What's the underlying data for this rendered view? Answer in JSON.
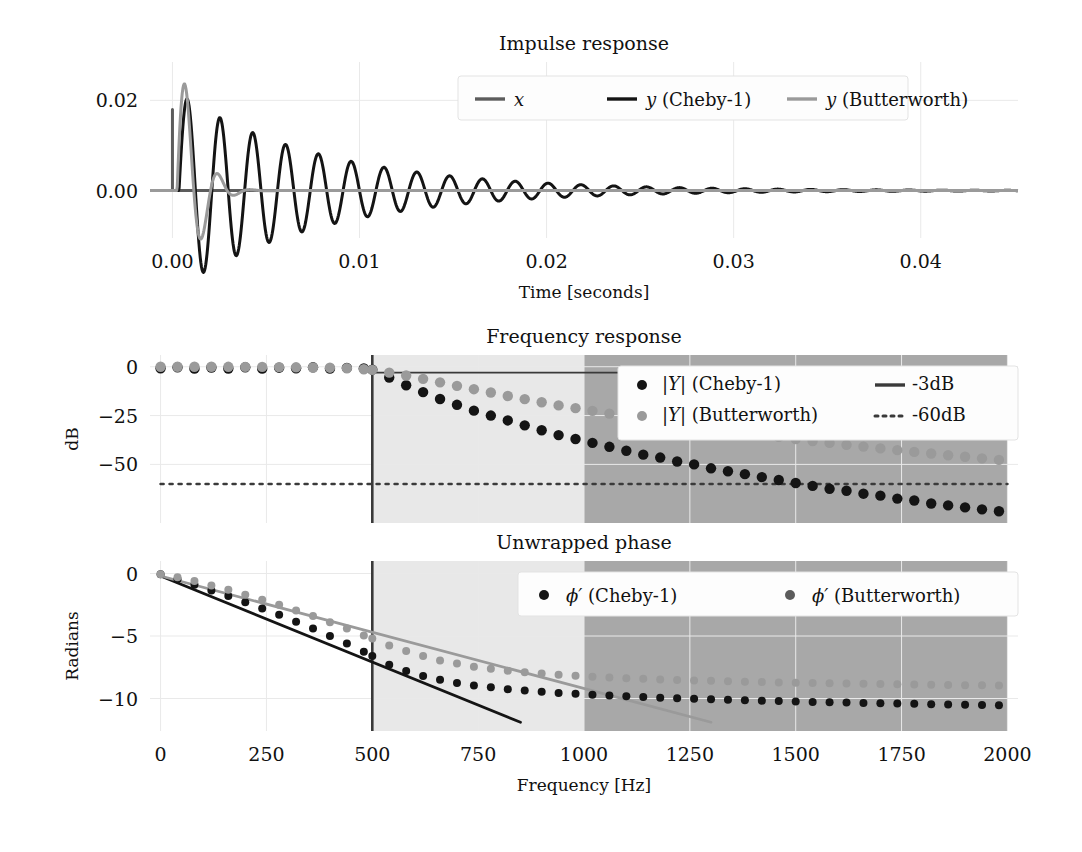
{
  "figure": {
    "background": "#ffffff",
    "colors": {
      "impulse": "#5c5c5c",
      "cheby": "#141414",
      "butter": "#9a9a9a",
      "band_pass_stop": "#e8e8e8",
      "band_stop": "#a8a8a8",
      "grid": "#e9e9e9",
      "cut_line": "#3a3a3a"
    }
  },
  "chart_data": [
    {
      "type": "line",
      "panel": "impulse",
      "title": "Impulse response",
      "xlabel": "Time [seconds]",
      "ylabel": "",
      "xlim": [
        -0.0012,
        0.0452
      ],
      "ylim": [
        -0.0105,
        0.0285
      ],
      "xticks": [
        0.0,
        0.01,
        0.02,
        0.03,
        0.04
      ],
      "xticklabels": [
        "0.00",
        "0.01",
        "0.02",
        "0.03",
        "0.04"
      ],
      "yticks": [
        0.0,
        0.02
      ],
      "yticklabels": [
        "0.00",
        "0.02"
      ],
      "grid": true,
      "legend_position": "upper center",
      "series": [
        {
          "name": "x",
          "style": "line",
          "color": "#5c5c5c",
          "description": "unit impulse at t=0, amplitude 0.018, zero elsewhere",
          "points": [
            [
              0.0,
              0.0
            ],
            [
              0.0,
              0.018
            ],
            [
              0.0,
              0.0
            ],
            [
              0.045,
              0.0
            ]
          ]
        },
        {
          "name": "y (Cheby-1)",
          "style": "line",
          "color": "#141414",
          "description": "Chebyshev type-1 impulse response: damped ringing, peak 0.0175 at t~0.0011, long decaying oscillation",
          "decay": 130.0,
          "frequency_hz": 570.0,
          "amplitude": 0.0215,
          "phase": 0.0,
          "delay": 0.00035
        },
        {
          "name": "y (Butterworth)",
          "style": "line",
          "color": "#9a9a9a",
          "description": "Butterworth impulse response: higher first peak 0.0255 at t~0.0008, fast decay, negligible after t=0.007",
          "decay": 620.0,
          "frequency_hz": 560.0,
          "amplitude": 0.0315,
          "phase": 0.0,
          "delay": 0.00025
        }
      ]
    },
    {
      "type": "scatter",
      "panel": "magnitude",
      "title": "Frequency response",
      "xlabel": "",
      "ylabel": "dB",
      "xlim": [
        -25,
        2025
      ],
      "ylim": [
        -80,
        6
      ],
      "xticks": [
        0,
        250,
        500,
        750,
        1000,
        1250,
        1500,
        1750,
        2000
      ],
      "xticklabels": [
        "0",
        "250",
        "500",
        "750",
        "1000",
        "1250",
        "1500",
        "1750",
        "2000"
      ],
      "yticks": [
        0,
        -25,
        -50
      ],
      "yticklabels": [
        "0",
        "−25",
        "−50"
      ],
      "grid": true,
      "legend_position": "upper right",
      "annotations": [
        {
          "kind": "vline",
          "x": 500,
          "label": "cutoff"
        },
        {
          "kind": "hline",
          "y": -3,
          "label": "-3dB",
          "x_from": 500,
          "x_to": 2000
        },
        {
          "kind": "hline",
          "y": -60,
          "label": "-60dB",
          "x_from": 0,
          "x_to": 2000
        },
        {
          "kind": "vspan",
          "x_from": 500,
          "x_to": 1000,
          "color": "#e8e8e8",
          "label": "transition band"
        },
        {
          "kind": "vspan",
          "x_from": 1000,
          "x_to": 2000,
          "color": "#a8a8a8",
          "label": "stop band"
        }
      ],
      "series": [
        {
          "name": "|Y| (Cheby-1)",
          "style": "dots",
          "color": "#141414",
          "x": [
            0,
            40,
            80,
            120,
            160,
            200,
            240,
            280,
            320,
            360,
            400,
            440,
            480,
            500,
            540,
            580,
            620,
            660,
            700,
            740,
            780,
            820,
            860,
            900,
            940,
            980,
            1020,
            1060,
            1100,
            1140,
            1180,
            1220,
            1260,
            1300,
            1340,
            1380,
            1420,
            1460,
            1500,
            1540,
            1580,
            1620,
            1660,
            1700,
            1740,
            1780,
            1820,
            1860,
            1900,
            1940,
            1980
          ],
          "y": [
            -0.8,
            -0.3,
            -1.0,
            -0.4,
            -0.9,
            -0.3,
            -1.0,
            -0.5,
            -0.8,
            -0.3,
            -1.0,
            -0.6,
            -0.9,
            -1.5,
            -5.5,
            -9.5,
            -13.0,
            -16.5,
            -19.5,
            -22.5,
            -25.0,
            -27.5,
            -30.0,
            -32.5,
            -35.0,
            -37.0,
            -39.0,
            -41.0,
            -43.0,
            -45.0,
            -46.5,
            -48.5,
            -50.0,
            -52.0,
            -53.5,
            -55.0,
            -56.5,
            -58.0,
            -59.5,
            -61.0,
            -62.5,
            -63.5,
            -65.0,
            -66.0,
            -67.5,
            -68.5,
            -70.0,
            -71.0,
            -72.0,
            -73.0,
            -74.0
          ]
        },
        {
          "name": "|Y| (Butterworth)",
          "style": "dots",
          "color": "#9a9a9a",
          "x": [
            0,
            40,
            80,
            120,
            160,
            200,
            240,
            280,
            320,
            360,
            400,
            440,
            480,
            500,
            540,
            580,
            620,
            660,
            700,
            740,
            780,
            820,
            860,
            900,
            940,
            980,
            1020,
            1060,
            1100,
            1140,
            1180,
            1220,
            1260,
            1300,
            1340,
            1380,
            1420,
            1460,
            1500,
            1540,
            1580,
            1620,
            1660,
            1700,
            1740,
            1780,
            1820,
            1860,
            1900,
            1940,
            1980
          ],
          "y": [
            0.0,
            0.0,
            0.0,
            0.0,
            -0.05,
            -0.1,
            -0.1,
            -0.2,
            -0.3,
            -0.4,
            -0.5,
            -0.8,
            -1.3,
            -1.6,
            -3.0,
            -4.5,
            -6.2,
            -8.0,
            -9.8,
            -11.5,
            -13.2,
            -15.0,
            -16.6,
            -18.2,
            -19.8,
            -21.2,
            -22.6,
            -24.0,
            -25.4,
            -26.7,
            -28.0,
            -29.2,
            -30.4,
            -31.5,
            -32.7,
            -33.8,
            -34.9,
            -35.9,
            -37.0,
            -38.0,
            -39.0,
            -40.0,
            -40.9,
            -41.8,
            -42.7,
            -43.6,
            -44.4,
            -45.3,
            -46.1,
            -46.9,
            -47.7
          ]
        }
      ]
    },
    {
      "type": "scatter",
      "panel": "phase",
      "title": "Unwrapped phase",
      "xlabel": "Frequency [Hz]",
      "ylabel": "Radians",
      "xlim": [
        -25,
        2025
      ],
      "ylim": [
        -12.6,
        1.0
      ],
      "xticks": [
        0,
        250,
        500,
        750,
        1000,
        1250,
        1500,
        1750,
        2000
      ],
      "xticklabels": [
        "0",
        "250",
        "500",
        "750",
        "1000",
        "1250",
        "1500",
        "1750",
        "2000"
      ],
      "yticks": [
        0,
        -5,
        -10
      ],
      "yticklabels": [
        "0",
        "−5",
        "−10"
      ],
      "grid": true,
      "legend_position": "upper right",
      "annotations": [
        {
          "kind": "vline",
          "x": 500,
          "label": "cutoff"
        },
        {
          "kind": "vspan",
          "x_from": 500,
          "x_to": 1000,
          "color": "#e8e8e8",
          "label": "transition band"
        },
        {
          "kind": "vspan",
          "x_from": 1000,
          "x_to": 2000,
          "color": "#a8a8a8",
          "label": "stop band"
        },
        {
          "kind": "tangent",
          "color": "#141414",
          "x_from": 0,
          "y_from": -0.2,
          "x_to": 850,
          "y_to": -11.9,
          "label": "group delay (Cheby-1)"
        },
        {
          "kind": "tangent",
          "color": "#9a9a9a",
          "x_from": 0,
          "y_from": -0.2,
          "x_to": 1300,
          "y_to": -11.9,
          "label": "group delay (Butterworth)"
        }
      ],
      "series": [
        {
          "name": "ϕ′ (Cheby-1)",
          "style": "dots",
          "color": "#141414",
          "x": [
            0,
            40,
            80,
            120,
            160,
            200,
            240,
            280,
            320,
            360,
            400,
            440,
            480,
            500,
            540,
            580,
            620,
            660,
            700,
            740,
            780,
            820,
            860,
            900,
            940,
            980,
            1020,
            1060,
            1100,
            1140,
            1180,
            1220,
            1260,
            1300,
            1340,
            1380,
            1420,
            1460,
            1500,
            1540,
            1580,
            1620,
            1660,
            1700,
            1740,
            1780,
            1820,
            1860,
            1900,
            1940,
            1980
          ],
          "y": [
            -0.05,
            -0.45,
            -0.9,
            -1.35,
            -1.8,
            -2.3,
            -2.8,
            -3.3,
            -3.85,
            -4.4,
            -5.0,
            -5.6,
            -6.25,
            -6.6,
            -7.3,
            -7.8,
            -8.2,
            -8.5,
            -8.75,
            -8.95,
            -9.1,
            -9.25,
            -9.35,
            -9.45,
            -9.55,
            -9.62,
            -9.7,
            -9.76,
            -9.82,
            -9.88,
            -9.93,
            -9.98,
            -10.02,
            -10.06,
            -10.1,
            -10.14,
            -10.17,
            -10.2,
            -10.24,
            -10.27,
            -10.3,
            -10.32,
            -10.35,
            -10.38,
            -10.4,
            -10.42,
            -10.45,
            -10.47,
            -10.49,
            -10.51,
            -10.53
          ]
        },
        {
          "name": "ϕ′ (Butterworth)",
          "style": "dots",
          "color": "#9a9a9a",
          "x": [
            0,
            40,
            80,
            120,
            160,
            200,
            240,
            280,
            320,
            360,
            400,
            440,
            480,
            500,
            540,
            580,
            620,
            660,
            700,
            740,
            780,
            820,
            860,
            900,
            940,
            980,
            1020,
            1060,
            1100,
            1140,
            1180,
            1220,
            1260,
            1300,
            1340,
            1380,
            1420,
            1460,
            1500,
            1540,
            1580,
            1620,
            1660,
            1700,
            1740,
            1780,
            1820,
            1860,
            1900,
            1940,
            1980
          ],
          "y": [
            -0.05,
            -0.3,
            -0.6,
            -0.95,
            -1.3,
            -1.7,
            -2.1,
            -2.5,
            -2.95,
            -3.4,
            -3.9,
            -4.4,
            -4.95,
            -5.2,
            -5.75,
            -6.2,
            -6.6,
            -6.95,
            -7.2,
            -7.45,
            -7.62,
            -7.78,
            -7.9,
            -8.0,
            -8.1,
            -8.18,
            -8.25,
            -8.31,
            -8.37,
            -8.42,
            -8.47,
            -8.51,
            -8.55,
            -8.58,
            -8.62,
            -8.65,
            -8.68,
            -8.71,
            -8.73,
            -8.76,
            -8.78,
            -8.8,
            -8.82,
            -8.84,
            -8.86,
            -8.88,
            -8.9,
            -8.91,
            -8.93,
            -8.94,
            -8.96
          ]
        }
      ]
    }
  ],
  "legends": {
    "impulse": {
      "items": [
        {
          "label": "x",
          "marker": "line",
          "color": "#5c5c5c",
          "italic_head": "x",
          "rest": ""
        },
        {
          "label": "y (Cheby-1)",
          "marker": "line",
          "color": "#141414",
          "italic_head": "y",
          "rest": " (Cheby-1)"
        },
        {
          "label": "y (Butterworth)",
          "marker": "line",
          "color": "#9a9a9a",
          "italic_head": "y",
          "rest": " (Butterworth)"
        }
      ]
    },
    "magnitude": {
      "items": [
        {
          "label": "|Y| (Cheby-1)",
          "marker": "dot",
          "color": "#141414",
          "italic_head": "|Y|",
          "rest": " (Cheby-1)"
        },
        {
          "label": "|Y| (Butterworth)",
          "marker": "dot",
          "color": "#9a9a9a",
          "italic_head": "|Y|",
          "rest": " (Butterworth)"
        },
        {
          "label": "-3dB",
          "marker": "line",
          "color": "#3a3a3a",
          "italic_head": "",
          "rest": "-3dB"
        },
        {
          "label": "-60dB",
          "marker": "dotted",
          "color": "#3a3a3a",
          "italic_head": "",
          "rest": "-60dB"
        }
      ]
    },
    "phase": {
      "items": [
        {
          "label": "ϕ′ (Cheby-1)",
          "marker": "dot",
          "color": "#141414",
          "italic_head": "ϕ′",
          "rest": " (Cheby-1)"
        },
        {
          "label": "ϕ′ (Butterworth)",
          "marker": "dot",
          "color": "#5c5c5c",
          "italic_head": "ϕ′",
          "rest": " (Butterworth)"
        }
      ]
    }
  }
}
